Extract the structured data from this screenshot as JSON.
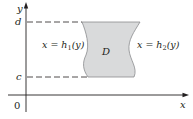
{
  "diagram": {
    "type": "region-between-curves",
    "axes": {
      "x_label": "x",
      "y_label": "y",
      "origin_label": "0"
    },
    "y_bounds": {
      "lower_label": "c",
      "upper_label": "d"
    },
    "region": {
      "label": "D",
      "fill_color": "#d9dadb",
      "stroke_color": "#8a8c8e"
    },
    "curves": {
      "left": {
        "eq_lhs": "x = h",
        "subscript": "1",
        "arg": "(y)"
      },
      "right": {
        "eq_lhs": "x = h",
        "subscript": "2",
        "arg": "(y)"
      }
    },
    "colors": {
      "axis": "#231f20",
      "dashed": "#231f20",
      "text": "#231f20"
    }
  }
}
